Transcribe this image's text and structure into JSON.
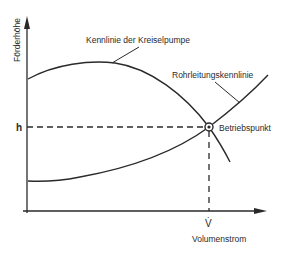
{
  "diagram": {
    "type": "pump-system-operating-point",
    "colors": {
      "line": "#2a2a2a",
      "background": "#ffffff"
    },
    "axes": {
      "y_label": "Förderhöhe",
      "x_label": "Volumenstrom"
    },
    "curves": {
      "pump_label": "Kennlinie der Kreiselpumpe",
      "pipe_label": "Rohrleitungskennlinie"
    },
    "operating_point": {
      "label": "Betriebspunkt",
      "h_symbol": "h",
      "v_symbol": "V̇"
    }
  }
}
